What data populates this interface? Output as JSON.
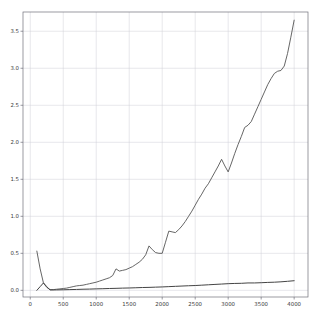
{
  "chart_data": {
    "type": "line",
    "title": "",
    "xlabel": "",
    "ylabel": "",
    "xlim": [
      -110,
      4210
    ],
    "ylim": [
      -0.09,
      3.76
    ],
    "grid": true,
    "legend": null,
    "xticks": [
      0,
      500,
      1000,
      1500,
      2000,
      2500,
      3000,
      3500,
      4000
    ],
    "xticklabels": [
      "0",
      "500",
      "1000",
      "1500",
      "2000",
      "2500",
      "3000",
      "3500",
      "4000"
    ],
    "yticks": [
      0.0,
      0.5,
      1.0,
      1.5,
      2.0,
      2.5,
      3.0,
      3.5
    ],
    "yticklabels": [
      "0.0",
      "0.5",
      "1.0",
      "1.5",
      "2.0",
      "2.5",
      "3.0",
      "3.5"
    ],
    "colors": {
      "series1": "#555555",
      "series2": "#444444",
      "grid": "#cfcfd6",
      "axes": "#6f6f7a",
      "background": "#ffffff"
    },
    "series": [
      {
        "name": "series-1",
        "color": "#555555",
        "linewidth": 0.9,
        "x": [
          100,
          150,
          200,
          250,
          300,
          350,
          400,
          450,
          500,
          550,
          600,
          650,
          700,
          750,
          800,
          850,
          900,
          950,
          1000,
          1050,
          1100,
          1150,
          1200,
          1250,
          1300,
          1350,
          1400,
          1450,
          1500,
          1550,
          1600,
          1650,
          1700,
          1750,
          1800,
          1850,
          1900,
          1950,
          2000,
          2050,
          2100,
          2150,
          2200,
          2250,
          2300,
          2350,
          2400,
          2450,
          2500,
          2550,
          2600,
          2650,
          2700,
          2750,
          2800,
          2850,
          2900,
          2950,
          3000,
          3050,
          3100,
          3150,
          3200,
          3250,
          3300,
          3350,
          3400,
          3450,
          3500,
          3550,
          3600,
          3650,
          3700,
          3750,
          3800,
          3850,
          3900,
          3950,
          4000
        ],
        "y": [
          0.53,
          0.29,
          0.1,
          0.04,
          0.01,
          0.01,
          0.015,
          0.02,
          0.025,
          0.03,
          0.04,
          0.05,
          0.06,
          0.065,
          0.07,
          0.08,
          0.09,
          0.1,
          0.11,
          0.125,
          0.14,
          0.155,
          0.17,
          0.2,
          0.29,
          0.26,
          0.27,
          0.28,
          0.3,
          0.32,
          0.35,
          0.38,
          0.42,
          0.48,
          0.6,
          0.55,
          0.51,
          0.5,
          0.5,
          0.65,
          0.8,
          0.79,
          0.78,
          0.82,
          0.87,
          0.93,
          1.0,
          1.07,
          1.15,
          1.23,
          1.3,
          1.38,
          1.44,
          1.52,
          1.6,
          1.68,
          1.77,
          1.68,
          1.6,
          1.72,
          1.85,
          1.97,
          2.08,
          2.2,
          2.23,
          2.28,
          2.38,
          2.48,
          2.58,
          2.68,
          2.78,
          2.86,
          2.93,
          2.96,
          2.97,
          3.03,
          3.2,
          3.42,
          3.65
        ]
      },
      {
        "name": "series-2",
        "color": "#444444",
        "linewidth": 1.0,
        "x": [
          100,
          150,
          200,
          250,
          300,
          400,
          500,
          600,
          700,
          800,
          900,
          1000,
          1100,
          1200,
          1300,
          1400,
          1500,
          1600,
          1700,
          1800,
          1900,
          2000,
          2100,
          2200,
          2300,
          2400,
          2500,
          2600,
          2700,
          2800,
          2900,
          3000,
          3100,
          3200,
          3300,
          3400,
          3500,
          3600,
          3700,
          3800,
          3900,
          4000
        ],
        "y": [
          0.0,
          0.05,
          0.1,
          0.05,
          0.005,
          0.006,
          0.008,
          0.01,
          0.012,
          0.015,
          0.017,
          0.02,
          0.022,
          0.025,
          0.027,
          0.03,
          0.032,
          0.035,
          0.038,
          0.04,
          0.043,
          0.046,
          0.05,
          0.054,
          0.058,
          0.062,
          0.065,
          0.07,
          0.075,
          0.08,
          0.085,
          0.09,
          0.093,
          0.095,
          0.1,
          0.1,
          0.103,
          0.107,
          0.11,
          0.115,
          0.122,
          0.13
        ]
      }
    ]
  },
  "figure": {
    "width": 316,
    "height": 328,
    "plot_left": 23,
    "plot_top": 12,
    "plot_right": 308,
    "plot_bottom": 297
  }
}
